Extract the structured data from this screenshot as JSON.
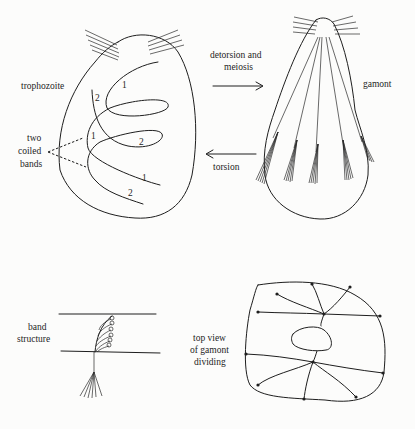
{
  "labels": {
    "trophozoite": "trophozoite",
    "two_coiled_bands": [
      "two",
      "coiled",
      "bands"
    ],
    "detorsion": [
      "detorsion and",
      "meiosis"
    ],
    "gamont": "gamont",
    "torsion": "torsion",
    "band_structure": [
      "band",
      "structure"
    ],
    "top_view": [
      "top view",
      "of gamont",
      "dividing"
    ]
  },
  "band_numbers": [
    "1",
    "2",
    "1",
    "2",
    "1",
    "2"
  ],
  "colors": {
    "ink": "#1e1e1e",
    "paper": "#fcfcfb"
  }
}
